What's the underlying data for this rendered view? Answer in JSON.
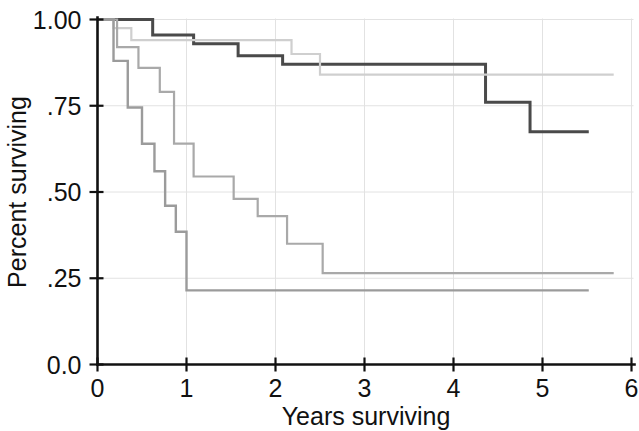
{
  "chart_data": {
    "type": "line",
    "title": "",
    "subtitle": "",
    "xlabel": "Years surviving",
    "ylabel": "Percent surviving",
    "xlim": [
      0,
      6
    ],
    "ylim": [
      0,
      1
    ],
    "xticks": [
      0,
      1,
      2,
      3,
      4,
      5,
      6
    ],
    "xticklabels": [
      "0",
      "1",
      "2",
      "3",
      "4",
      "5",
      "6"
    ],
    "yticks": [
      0,
      0.25,
      0.5,
      0.75,
      1
    ],
    "yticklabels": [
      "0.0",
      ".25",
      ".50",
      ".75",
      "1.00"
    ],
    "grid": true,
    "grid_color": "#e2e2e2",
    "legend": "none",
    "step_style": "post",
    "series": [
      {
        "name": "curve-1-highest-survival",
        "color": "#4a4a4a",
        "linewidth": 3.0,
        "x": [
          0.0,
          0.06,
          0.55,
          0.62,
          1.0,
          1.08,
          1.5,
          1.58,
          2.0,
          2.08,
          2.4,
          4.28,
          4.36,
          4.78,
          4.86,
          5.52
        ],
        "y": [
          1.0,
          1.0,
          1.0,
          0.955,
          0.955,
          0.93,
          0.93,
          0.895,
          0.895,
          0.87,
          0.87,
          0.87,
          0.76,
          0.76,
          0.675,
          0.675
        ],
        "final_value": 0.675,
        "end_x": 5.52
      },
      {
        "name": "curve-2-light-plateau",
        "color": "#cfcfcf",
        "linewidth": 2.2,
        "x": [
          0.0,
          0.1,
          0.18,
          0.3,
          0.38,
          0.55,
          2.1,
          2.18,
          2.42,
          2.5,
          5.8
        ],
        "y": [
          1.0,
          1.0,
          0.975,
          0.975,
          0.94,
          0.94,
          0.94,
          0.9,
          0.9,
          0.84,
          0.84
        ],
        "final_value": 0.84,
        "end_x": 5.8
      },
      {
        "name": "curve-3-mid-gray-decline",
        "color": "#a9a9a9",
        "linewidth": 2.2,
        "x": [
          0.0,
          0.14,
          0.22,
          0.38,
          0.46,
          0.62,
          0.7,
          0.78,
          0.86,
          1.0,
          1.08,
          1.45,
          1.53,
          1.72,
          1.8,
          2.05,
          2.13,
          2.45,
          2.53,
          5.8
        ],
        "y": [
          1.0,
          1.0,
          0.92,
          0.92,
          0.86,
          0.86,
          0.79,
          0.79,
          0.64,
          0.64,
          0.545,
          0.545,
          0.48,
          0.48,
          0.43,
          0.43,
          0.35,
          0.35,
          0.265,
          0.265
        ],
        "final_value": 0.265,
        "end_x": 5.8
      },
      {
        "name": "curve-4-steepest-decline",
        "color": "#9b9b9b",
        "linewidth": 2.4,
        "x": [
          0.0,
          0.1,
          0.18,
          0.26,
          0.34,
          0.42,
          0.5,
          0.58,
          0.64,
          0.7,
          0.76,
          0.82,
          0.88,
          0.94,
          1.0,
          5.52
        ],
        "y": [
          1.0,
          1.0,
          0.88,
          0.88,
          0.745,
          0.745,
          0.64,
          0.64,
          0.56,
          0.56,
          0.46,
          0.46,
          0.385,
          0.385,
          0.215,
          0.215
        ],
        "final_value": 0.215,
        "end_x": 5.52
      }
    ]
  },
  "axes": {
    "x_title": "Years surviving",
    "y_title": "Percent surviving"
  }
}
